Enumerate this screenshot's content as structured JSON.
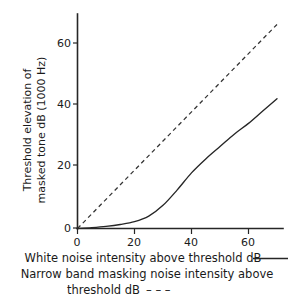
{
  "chart_data": {
    "type": "line",
    "title": "",
    "xlabel": "White noise intensity above threshold dB",
    "ylabel": "Threshold elevation of masked tone dB (1000 Hz)",
    "ylabel_line1": "Threshold elevation of",
    "ylabel_line2": "masked tone dB (1000 Hz)",
    "xlim": [
      0,
      70
    ],
    "ylim": [
      0,
      69
    ],
    "xticks": [
      0,
      20,
      40,
      60
    ],
    "yticks": [
      0,
      20,
      40,
      60
    ],
    "xtick_labels": [
      "0",
      "20",
      "40",
      "60"
    ],
    "ytick_labels": [
      "0",
      "20",
      "40",
      "60"
    ],
    "grid": false,
    "legend_position": "below-axes",
    "series": [
      {
        "name": "White noise intensity above threshold dB",
        "style": "solid",
        "color": "#262626",
        "x": [
          0,
          5,
          10,
          15,
          20,
          25,
          30,
          35,
          40,
          45,
          50,
          55,
          60,
          65,
          70
        ],
        "values": [
          0,
          0.3,
          0.7,
          1.3,
          2.2,
          4.0,
          7.5,
          12.5,
          18.0,
          22.5,
          26.5,
          30.5,
          34.0,
          38.0,
          42.0
        ]
      },
      {
        "name": "Narrow band masking noise intensity above threshold dB",
        "style": "dashed",
        "color": "#333333",
        "x": [
          0,
          70
        ],
        "values": [
          0,
          66
        ]
      }
    ]
  },
  "caption": {
    "line1_text": "White noise intensity above threshold dB",
    "line1_key": "solid-line",
    "line2_text": "Narrow band masking noise intensity above",
    "line3_text": "threshold dB",
    "line3_key": "dashed-line",
    "dash_glyph": "– – –"
  },
  "colors": {
    "background": "#ffffff",
    "ink": "#262626",
    "solid_series": "#262626",
    "dashed_series": "#333333"
  }
}
